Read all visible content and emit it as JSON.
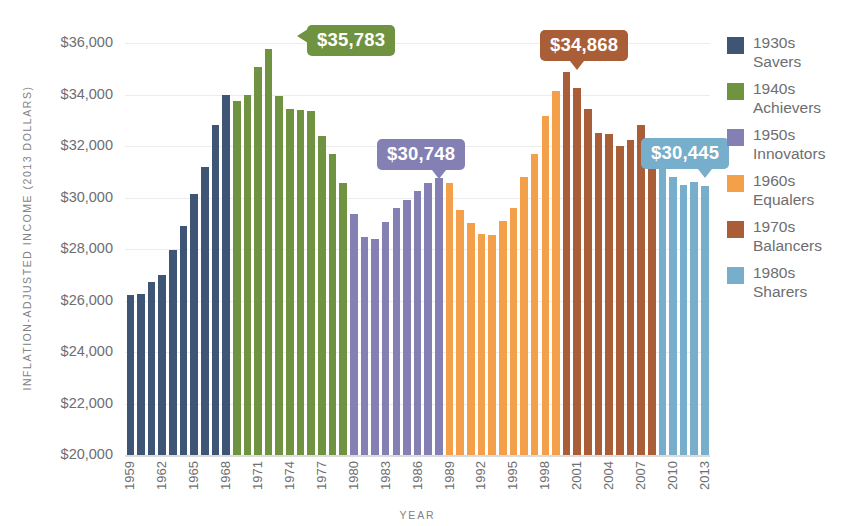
{
  "chart_data": {
    "type": "bar",
    "title": "",
    "xlabel": "YEAR",
    "ylabel": "INFLATION-ADJUSTED INCOME (2013 DOLLARS)",
    "ylim": [
      20000,
      36000
    ],
    "ytick_labels": [
      "$36,000",
      "$34,000",
      "$32,000",
      "$30,000",
      "$28,000",
      "$26,000",
      "$24,000",
      "$22,000",
      "$20,000"
    ],
    "ytick_values": [
      36000,
      34000,
      32000,
      30000,
      28000,
      26000,
      24000,
      22000,
      20000
    ],
    "grid": true,
    "legend_position": "right",
    "x": [
      1959,
      1960,
      1961,
      1962,
      1963,
      1964,
      1965,
      1966,
      1967,
      1968,
      1969,
      1970,
      1971,
      1972,
      1973,
      1974,
      1975,
      1976,
      1977,
      1978,
      1979,
      1980,
      1981,
      1982,
      1983,
      1984,
      1985,
      1986,
      1987,
      1988,
      1989,
      1990,
      1991,
      1992,
      1993,
      1994,
      1995,
      1996,
      1997,
      1998,
      1999,
      2000,
      2001,
      2002,
      2003,
      2004,
      2005,
      2006,
      2007,
      2008,
      2009,
      2010,
      2011,
      2012,
      2013
    ],
    "xtick_labels": [
      "1959",
      "1962",
      "1965",
      "1968",
      "1971",
      "1974",
      "1977",
      "1980",
      "1983",
      "1986",
      "1989",
      "1992",
      "1995",
      "1998",
      "2001",
      "2004",
      "2007",
      "2010",
      "2013"
    ],
    "values": [
      26200,
      26250,
      26700,
      27000,
      27950,
      28900,
      30150,
      31200,
      32800,
      34000,
      33750,
      34000,
      35050,
      35783,
      33950,
      33450,
      33400,
      33350,
      32400,
      31700,
      30550,
      29350,
      28450,
      28400,
      29050,
      29600,
      29900,
      30250,
      30550,
      30748,
      30550,
      29500,
      29000,
      28600,
      28550,
      29100,
      29600,
      30800,
      31700,
      33150,
      34150,
      34868,
      34250,
      33450,
      32500,
      32450,
      32000,
      32250,
      32800,
      31700,
      31200,
      30800,
      30500,
      30600,
      30445
    ],
    "colors": {
      "savers": "#3f5575",
      "achievers": "#6f9340",
      "innovators": "#8480b4",
      "equalers": "#f4a04a",
      "balancers": "#a95e38",
      "sharers": "#77aecb"
    },
    "segments": [
      {
        "key": "savers",
        "label_top": "1930s",
        "label_bottom": "Savers",
        "start": 1959,
        "end": 1968,
        "color": "#3f5575"
      },
      {
        "key": "achievers",
        "label_top": "1940s",
        "label_bottom": "Achievers",
        "start": 1969,
        "end": 1979,
        "color": "#6f9340"
      },
      {
        "key": "innovators",
        "label_top": "1950s",
        "label_bottom": "Innovators",
        "start": 1980,
        "end": 1988,
        "color": "#8480b4"
      },
      {
        "key": "equalers",
        "label_top": "1960s",
        "label_bottom": "Equalers",
        "start": 1989,
        "end": 1999,
        "color": "#f4a04a"
      },
      {
        "key": "balancers",
        "label_top": "1970s",
        "label_bottom": "Balancers",
        "start": 2000,
        "end": 2008,
        "color": "#a95e38"
      },
      {
        "key": "sharers",
        "label_top": "1980s",
        "label_bottom": "Sharers",
        "start": 2009,
        "end": 2013,
        "color": "#77aecb"
      }
    ],
    "annotations": [
      {
        "id": "peak-achievers",
        "text": "$35,783",
        "value": 35783,
        "year": 1972,
        "color": "#6f9340",
        "tail": "down"
      },
      {
        "id": "peak-innovators",
        "text": "$30,748",
        "value": 30748,
        "year": 1988,
        "color": "#8480b4",
        "tail": "down"
      },
      {
        "id": "peak-balancers",
        "text": "$34,868",
        "value": 34868,
        "year": 2001,
        "color": "#a95e38",
        "tail": "down"
      },
      {
        "id": "peak-sharers",
        "text": "$30,445",
        "value": 30445,
        "year": 2013,
        "color": "#77aecb",
        "tail": "down"
      }
    ]
  },
  "legend": {
    "items": [
      {
        "top": "1930s",
        "bottom": "Savers",
        "color": "#3f5575"
      },
      {
        "top": "1940s",
        "bottom": "Achievers",
        "color": "#6f9340"
      },
      {
        "top": "1950s",
        "bottom": "Innovators",
        "color": "#8480b4"
      },
      {
        "top": "1960s",
        "bottom": "Equalers",
        "color": "#f4a04a"
      },
      {
        "top": "1970s",
        "bottom": "Balancers",
        "color": "#a95e38"
      },
      {
        "top": "1980s",
        "bottom": "Sharers",
        "color": "#77aecb"
      }
    ]
  }
}
